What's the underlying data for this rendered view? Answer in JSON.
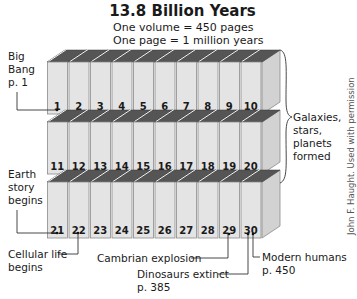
{
  "title": "13.8 Billion Years",
  "subtitle_lines": [
    "One volume = 450 pages",
    "One page = 1 million years"
  ],
  "volumes": {
    "rows": [
      [
        "1",
        "2",
        "3",
        "4",
        "5",
        "6",
        "7",
        "8",
        "9",
        "10"
      ],
      [
        "11",
        "12",
        "13",
        "14",
        "15",
        "16",
        "17",
        "18",
        "19",
        "20"
      ],
      [
        "21",
        "22",
        "23",
        "24",
        "25",
        "26",
        "27",
        "28",
        "29",
        "30"
      ]
    ]
  },
  "annotations": {
    "big_bang": [
      "Big",
      "Bang",
      "p. 1"
    ],
    "galaxies": [
      "Galaxies,",
      "stars,",
      "planets",
      "formed"
    ],
    "earth_story": [
      "Earth",
      "story",
      "begins"
    ],
    "cellular_life": [
      "Cellular life",
      "begins"
    ],
    "cambrian": "Cambrian explosion",
    "dinosaurs": [
      "Dinosaurs extinct",
      "p. 385"
    ],
    "modern_humans": [
      "Modern humans",
      "p. 450"
    ]
  },
  "credit": "John F. Haught. Used with permission",
  "colors": {
    "book_face": "#e4e4e4",
    "book_top": "#555555",
    "book_side": "#d2d2d2",
    "outline": "#8a8a8a"
  }
}
